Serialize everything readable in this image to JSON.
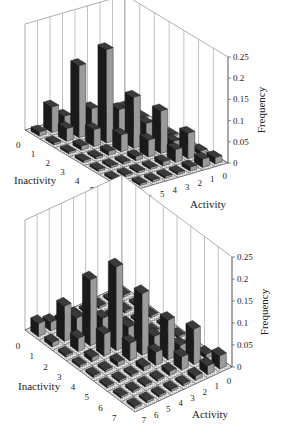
{
  "chart_data": [
    {
      "type": "bar3d",
      "title": "",
      "xlabel": "Inactivity",
      "ylabel": "Activity",
      "zlabel": "Frequency",
      "inactivity_ticks": [
        "0",
        "1",
        "2",
        "3",
        "4",
        "5",
        "6"
      ],
      "activity_ticks": [
        "7",
        "6",
        "5",
        "4",
        "3",
        "2",
        "1",
        "0"
      ],
      "z_ticks": [
        "0",
        "0.05",
        "0.1",
        "0.15",
        "0.2",
        "0.25"
      ],
      "zlim": [
        0,
        0.25
      ],
      "grid": true,
      "rows_inactivity": [
        0,
        1,
        2,
        3,
        4,
        5,
        6
      ],
      "cols_activity": [
        0,
        1,
        2,
        3,
        4,
        5,
        6,
        7
      ],
      "values": [
        [
          0.005,
          0.005,
          0.005,
          0.01,
          0.015,
          0.03,
          0.06,
          0.01
        ],
        [
          0.005,
          0.005,
          0.01,
          0.02,
          0.06,
          0.17,
          0.03,
          0.005
        ],
        [
          0.005,
          0.005,
          0.02,
          0.07,
          0.22,
          0.04,
          0.01,
          0.005
        ],
        [
          0.005,
          0.01,
          0.05,
          0.12,
          0.04,
          0.01,
          0.005,
          0.005
        ],
        [
          0.005,
          0.02,
          0.1,
          0.04,
          0.01,
          0.005,
          0.005,
          0.005
        ],
        [
          0.01,
          0.06,
          0.03,
          0.01,
          0.005,
          0.005,
          0.005,
          0.005
        ],
        [
          0.015,
          0.02,
          0.01,
          0.005,
          0.005,
          0.005,
          0.005,
          0.005
        ]
      ]
    },
    {
      "type": "bar3d",
      "title": "",
      "xlabel": "Inactivity",
      "ylabel": "Activity",
      "zlabel": "Frequency",
      "inactivity_ticks": [
        "0",
        "1",
        "2",
        "3",
        "4",
        "5",
        "6",
        "7"
      ],
      "activity_ticks": [
        "7",
        "6",
        "5",
        "4",
        "3",
        "2",
        "1",
        "0"
      ],
      "z_ticks": [
        "0",
        "0.05",
        "0.1",
        "0.15",
        "0.2",
        "0.25"
      ],
      "zlim": [
        0,
        0.25
      ],
      "grid": true,
      "rows_inactivity": [
        0,
        1,
        2,
        3,
        4,
        5,
        6,
        7
      ],
      "cols_activity": [
        0,
        1,
        2,
        3,
        4,
        5,
        6,
        7
      ],
      "values": [
        [
          0.005,
          0.005,
          0.005,
          0.005,
          0.01,
          0.01,
          0.02,
          0.03
        ],
        [
          0.005,
          0.005,
          0.005,
          0.01,
          0.02,
          0.04,
          0.08,
          0.01
        ],
        [
          0.005,
          0.005,
          0.01,
          0.02,
          0.05,
          0.15,
          0.03,
          0.005
        ],
        [
          0.005,
          0.005,
          0.01,
          0.04,
          0.19,
          0.05,
          0.01,
          0.005
        ],
        [
          0.005,
          0.01,
          0.03,
          0.14,
          0.04,
          0.01,
          0.005,
          0.005
        ],
        [
          0.005,
          0.02,
          0.09,
          0.03,
          0.01,
          0.005,
          0.005,
          0.005
        ],
        [
          0.01,
          0.08,
          0.03,
          0.01,
          0.005,
          0.005,
          0.005,
          0.005
        ],
        [
          0.03,
          0.02,
          0.01,
          0.005,
          0.005,
          0.005,
          0.005,
          0.005
        ]
      ]
    }
  ]
}
